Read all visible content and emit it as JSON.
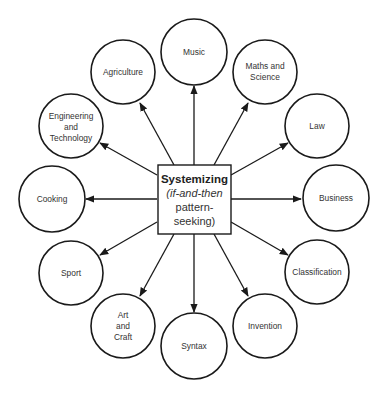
{
  "diagram": {
    "center": {
      "title": "Systemizing",
      "line2": "(if-and-then",
      "line3": "pattern-",
      "line4": "seeking)"
    },
    "nodes": [
      {
        "id": "music",
        "lines": [
          "Music"
        ]
      },
      {
        "id": "maths",
        "lines": [
          "Maths and",
          "Science"
        ]
      },
      {
        "id": "law",
        "lines": [
          "Law"
        ]
      },
      {
        "id": "business",
        "lines": [
          "Business"
        ]
      },
      {
        "id": "classification",
        "lines": [
          "Classification"
        ]
      },
      {
        "id": "invention",
        "lines": [
          "Invention"
        ]
      },
      {
        "id": "syntax",
        "lines": [
          "Syntax"
        ]
      },
      {
        "id": "art",
        "lines": [
          "Art",
          "and",
          "Craft"
        ]
      },
      {
        "id": "sport",
        "lines": [
          "Sport"
        ]
      },
      {
        "id": "cooking",
        "lines": [
          "Cooking"
        ]
      },
      {
        "id": "engineering",
        "lines": [
          "Engineering",
          "and",
          "Technology"
        ]
      },
      {
        "id": "agriculture",
        "lines": [
          "Agriculture"
        ]
      }
    ],
    "colors": {
      "stroke": "#1a1a1a",
      "text": "#333333",
      "background": "#ffffff"
    }
  }
}
